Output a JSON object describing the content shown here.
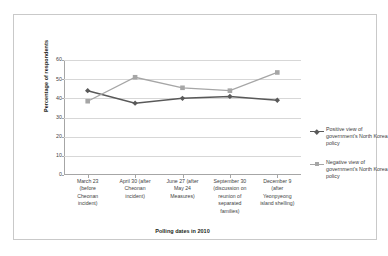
{
  "chart_data": {
    "type": "line",
    "title": "",
    "xlabel": "Polling dates in 2010",
    "ylabel": "Percentage of respondents",
    "ylim": [
      0,
      60
    ],
    "yticks": [
      0,
      10,
      20,
      30,
      40,
      50,
      60
    ],
    "grid": true,
    "legend_position": "right",
    "categories": [
      "March 23 (before Cheonan incident)",
      "April 30 (after Cheonan incident)",
      "June 27 (after May 24 Measures)",
      "September 30 (discussion on reunion of separated families)",
      "December 9 (after Yeonpyeong island shelling)"
    ],
    "category_lines": [
      [
        "March 23",
        "(before",
        "Cheonan",
        "incident)"
      ],
      [
        "April 30 (after",
        "Cheonan",
        "incident)"
      ],
      [
        "June 27 (after",
        "May 24",
        "Measures)"
      ],
      [
        "September 30",
        "(discussion on",
        "reunion of",
        "separated",
        "families)"
      ],
      [
        "December 9",
        "(after",
        "Yeonpyeong",
        "island shelling)"
      ]
    ],
    "series": [
      {
        "name": "Positive view of government's North Korea policy",
        "color": "#595959",
        "marker": "diamond",
        "values": [
          44,
          37.5,
          40,
          41,
          39
        ]
      },
      {
        "name": "Negative view of government's North Korea policy",
        "color": "#a6a6a6",
        "marker": "square",
        "values": [
          38.5,
          51,
          45.5,
          44,
          53.5
        ]
      }
    ]
  },
  "legend": {
    "entries": [
      "Positive view of government's North Korea policy",
      "Negative view of government's North Korea policy"
    ]
  }
}
